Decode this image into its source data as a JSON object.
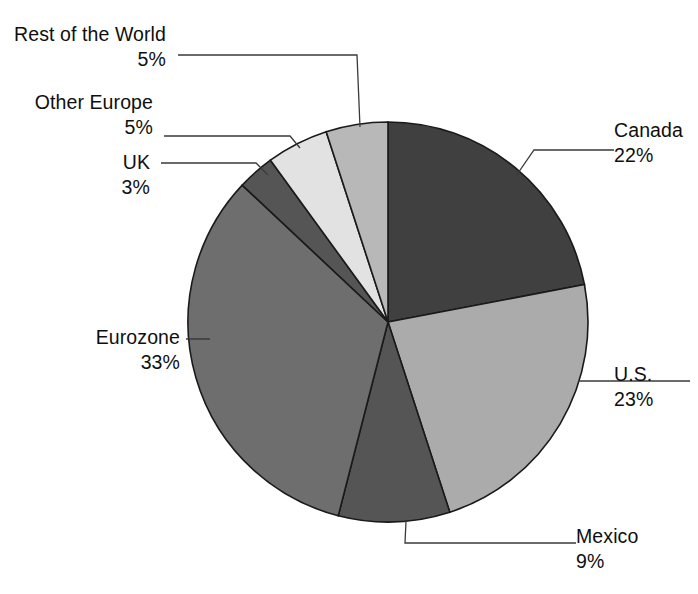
{
  "chart_data": {
    "type": "pie",
    "title": "",
    "subtitle": "",
    "xlabel": "",
    "ylabel": "",
    "legend_position": "callout-labels",
    "grid": false,
    "units": "percent",
    "start_angle_deg": 0,
    "direction": "clockwise",
    "total": 100,
    "categories": [
      "Canada",
      "U.S.",
      "Mexico",
      "Eurozone",
      "UK",
      "Other Europe",
      "Rest of the World"
    ],
    "values": [
      22,
      23,
      9,
      33,
      3,
      5,
      5
    ],
    "slices": [
      {
        "label": "Canada",
        "value": 22,
        "value_text": "22%",
        "color": "#404040",
        "start_deg": 0,
        "end_deg": 79.2,
        "label_side": "right"
      },
      {
        "label": "U.S.",
        "value": 23,
        "value_text": "23%",
        "color": "#ababab",
        "start_deg": 79.2,
        "end_deg": 162.0,
        "label_side": "right"
      },
      {
        "label": "Mexico",
        "value": 9,
        "value_text": "9%",
        "color": "#555555",
        "start_deg": 162.0,
        "end_deg": 194.4,
        "label_side": "right"
      },
      {
        "label": "Eurozone",
        "value": 33,
        "value_text": "33%",
        "color": "#6e6e6e",
        "start_deg": 194.4,
        "end_deg": 313.2,
        "label_side": "left"
      },
      {
        "label": "UK",
        "value": 3,
        "value_text": "3%",
        "color": "#555555",
        "start_deg": 313.2,
        "end_deg": 324.0,
        "label_side": "left"
      },
      {
        "label": "Other Europe",
        "value": 5,
        "value_text": "5%",
        "color": "#e2e2e2",
        "start_deg": 324.0,
        "end_deg": 342.0,
        "label_side": "left"
      },
      {
        "label": "Rest of the World",
        "value": 5,
        "value_text": "5%",
        "color": "#b8b8b8",
        "start_deg": 342.0,
        "end_deg": 360.0,
        "label_side": "left"
      }
    ],
    "colors": {
      "outline": "#1a1a1a",
      "leader_line": "#3a3a3a",
      "text": "#0f0f0f",
      "background": "#ffffff"
    },
    "geometry": {
      "center_x": 388,
      "center_y": 322,
      "radius": 200
    }
  }
}
